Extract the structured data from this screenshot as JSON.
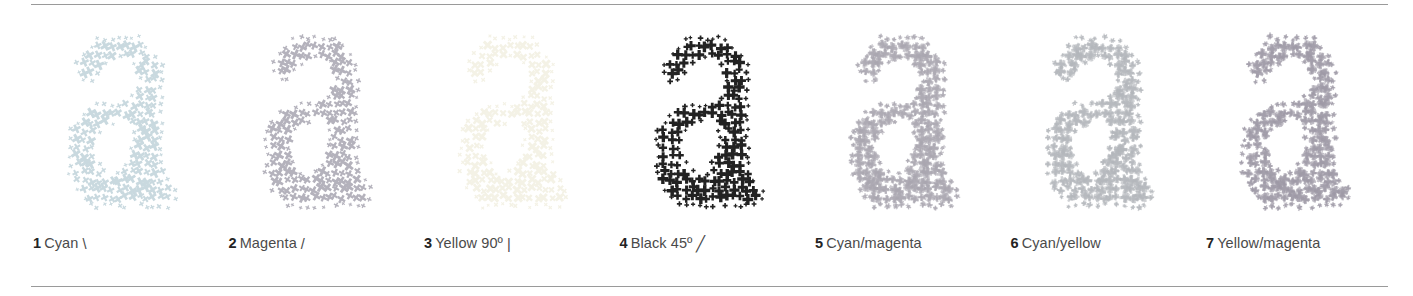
{
  "figure": {
    "name": "halftone-screen-angles-comparison",
    "background_color": "#ffffff",
    "rule_color": "#9a9a9a",
    "panel_count": 7,
    "letterform": "a"
  },
  "panels": [
    {
      "number": "1",
      "label": "Cyan",
      "angle_glyph": "\\",
      "angle_deg": 15,
      "dot_color": "#c9d9df",
      "dot_shape": "x-cross",
      "caption": "1 Cyan \\"
    },
    {
      "number": "2",
      "label": "Magenta",
      "angle_glyph": "/",
      "angle_deg": 75,
      "dot_color": "#b4b2bc",
      "dot_shape": "x-cross",
      "caption": "2 Magenta /"
    },
    {
      "number": "3",
      "label": "Yellow 90º",
      "angle_glyph": "|",
      "angle_deg": 90,
      "dot_color": "#f4f2e6",
      "dot_shape": "x-cross",
      "caption": "3 Yellow 90º |"
    },
    {
      "number": "4",
      "label": "Black 45º",
      "angle_glyph": "╱",
      "angle_deg": 45,
      "dot_color": "#222222",
      "dot_shape": "plus-cross",
      "caption": "4 Black 45º ╱"
    },
    {
      "number": "5",
      "label": "Cyan/magenta",
      "angle_glyph": "",
      "angle_deg": null,
      "dot_color": "#a9a6b0",
      "dot_shape": "rosette",
      "caption": "5 Cyan/magenta"
    },
    {
      "number": "6",
      "label": "Cyan/yellow",
      "angle_glyph": "",
      "angle_deg": null,
      "dot_color": "#b3b6bb",
      "dot_shape": "rosette",
      "caption": "6 Cyan/yellow"
    },
    {
      "number": "7",
      "label": "Yellow/magenta",
      "angle_glyph": "",
      "angle_deg": null,
      "dot_color": "#9e9aa6",
      "dot_shape": "rosette",
      "caption": "7 Yellow/magenta"
    }
  ]
}
